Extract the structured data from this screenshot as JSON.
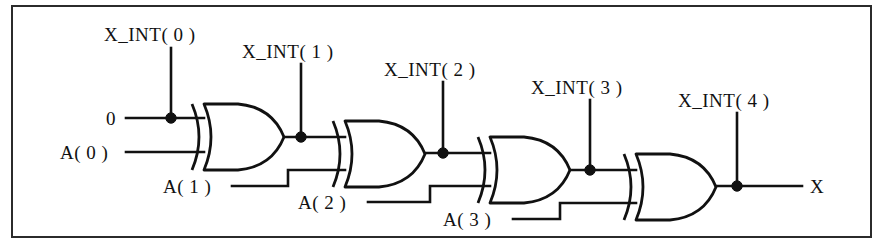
{
  "figure": {
    "kind": "logic-circuit-diagram",
    "frame": {
      "border_color": "#2b2b2b",
      "background": "#ffffff"
    },
    "line_color": "#111111"
  },
  "inputs": [
    {
      "id": "const0",
      "label": "0",
      "x": 104,
      "y": 118,
      "anchor": "left"
    },
    {
      "id": "a0",
      "label": "A( 0 )",
      "x": 60,
      "y": 152,
      "anchor": "left"
    },
    {
      "id": "a1",
      "label": "A( 1 )",
      "x": 163,
      "y": 186,
      "anchor": "left"
    },
    {
      "id": "a2",
      "label": "A( 2 )",
      "x": 298,
      "y": 203,
      "anchor": "left"
    },
    {
      "id": "a3",
      "label": "A( 3 )",
      "x": 443,
      "y": 219,
      "anchor": "left"
    }
  ],
  "intermediates": [
    {
      "id": "xint0",
      "label": "X_INT( 0 )",
      "label_x": 104,
      "label_y": 25,
      "stub_x": 171,
      "stub_top": 48,
      "node_y": 118
    },
    {
      "id": "xint1",
      "label": "X_INT( 1 )",
      "label_x": 242,
      "label_y": 42,
      "stub_x": 301,
      "stub_top": 64,
      "node_y": 137
    },
    {
      "id": "xint2",
      "label": "X_INT( 2 )",
      "label_x": 384,
      "label_y": 60,
      "stub_x": 443,
      "stub_top": 82,
      "node_y": 153
    },
    {
      "id": "xint3",
      "label": "X_INT( 3 )",
      "label_x": 531,
      "label_y": 78,
      "stub_x": 590,
      "stub_top": 100,
      "node_y": 170
    },
    {
      "id": "xint4",
      "label": "X_INT( 4 )",
      "label_x": 678,
      "label_y": 91,
      "stub_x": 737,
      "stub_top": 113,
      "node_y": 186
    }
  ],
  "output": {
    "id": "x",
    "label": "X",
    "x": 810,
    "y": 186
  },
  "gates": [
    {
      "id": "gate1",
      "type": "XOR",
      "x": 192,
      "y": 104,
      "width": 92,
      "height": 66
    },
    {
      "id": "gate2",
      "type": "XOR",
      "x": 333,
      "y": 121,
      "width": 92,
      "height": 66
    },
    {
      "id": "gate3",
      "type": "XOR",
      "x": 478,
      "y": 137,
      "width": 92,
      "height": 66
    },
    {
      "id": "gate4",
      "type": "XOR",
      "x": 624,
      "y": 154,
      "width": 92,
      "height": 66
    }
  ],
  "junctions": [
    {
      "id": "j0",
      "x": 171,
      "y": 118
    },
    {
      "id": "j1",
      "x": 301,
      "y": 137
    },
    {
      "id": "j2",
      "x": 443,
      "y": 153
    },
    {
      "id": "j3",
      "x": 590,
      "y": 170
    },
    {
      "id": "j4",
      "x": 737,
      "y": 186
    }
  ]
}
